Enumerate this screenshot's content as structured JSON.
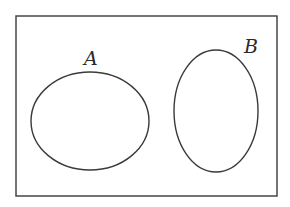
{
  "diagram": {
    "type": "venn",
    "universe": {
      "x": 16,
      "y": 16,
      "width": 261,
      "height": 180,
      "stroke": "#3a3a3a"
    },
    "sets": [
      {
        "label": "A",
        "cx": 90,
        "cy": 121,
        "rx": 59,
        "ry": 49,
        "label_x": 84,
        "label_y": 65
      },
      {
        "label": "B",
        "cx": 216,
        "cy": 111,
        "rx": 42,
        "ry": 61,
        "label_x": 244,
        "label_y": 53
      }
    ],
    "relationship": "disjoint"
  }
}
